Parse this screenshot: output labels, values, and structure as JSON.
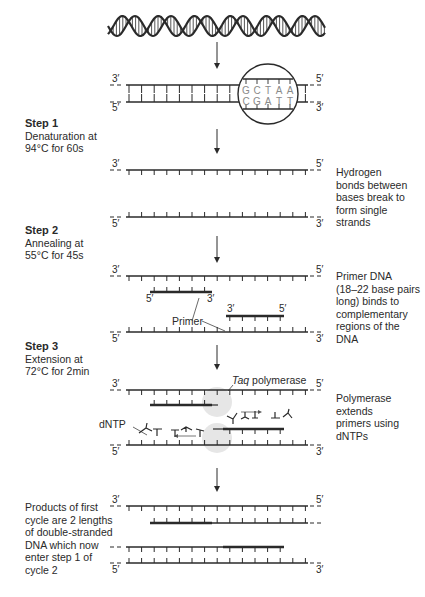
{
  "steps": [
    {
      "title": "Step 1",
      "line1": "Denaturation at",
      "line2": "94°C for 60s"
    },
    {
      "title": "Step 2",
      "line1": "Annealing at",
      "line2": "55°C for 45s"
    },
    {
      "title": "Step 3",
      "line1": "Extension at",
      "line2": "72°C for 2min"
    }
  ],
  "annotations": {
    "hydrogen": [
      "Hydrogen",
      "bonds between",
      "bases break to",
      "form single",
      "strands"
    ],
    "primer_dna": [
      "Primer DNA",
      "(18–22 base pairs",
      "long) binds to",
      "complementary",
      "regions of the",
      "DNA"
    ],
    "polymerase": [
      "Polymerase",
      "extends",
      "primers using",
      "dNTPs"
    ],
    "products": [
      "Products of first",
      "cycle are 2 lengths",
      "of double-stranded",
      "DNA which now",
      "enter step 1 of",
      "cycle 2"
    ]
  },
  "labels": {
    "three_prime": "3′",
    "five_prime": "5′",
    "primer": "Primer",
    "taq": "Taq",
    "polymerase": " polymerase",
    "dntp": "dNTP"
  },
  "magnified_bases": {
    "top": [
      "G",
      "C",
      "T",
      "A",
      "A"
    ],
    "bottom": [
      "C",
      "G",
      "A",
      "T",
      "T"
    ]
  },
  "colors": {
    "strand": "#2a2a2a",
    "base_letter": "#8a8a8a",
    "polymerase_blob": "#e6e6e6"
  }
}
